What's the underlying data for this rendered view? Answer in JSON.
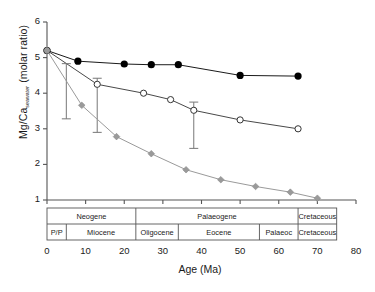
{
  "chart_data": {
    "type": "line",
    "title": "",
    "xlabel": "Age (Ma)",
    "ylabel_html": "Mg/Ca<sub>seawater</sub> (molar ratio)",
    "ylabel_main": "Mg/Ca",
    "ylabel_sub": "seawater",
    "ylabel_tail": " (molar ratio)",
    "xlim": [
      0,
      80
    ],
    "ylim": [
      1,
      6
    ],
    "xticks": [
      0,
      10,
      20,
      30,
      40,
      50,
      60,
      70,
      80
    ],
    "yticks": [
      1,
      2,
      3,
      4,
      5,
      6
    ],
    "grid": false,
    "legend": "none",
    "series": [
      {
        "name": "black-filled-circles",
        "marker": "filled-circle",
        "color": "#000000",
        "x": [
          0,
          8,
          20,
          27,
          34,
          50,
          65
        ],
        "values": [
          5.2,
          4.9,
          4.82,
          4.8,
          4.8,
          4.5,
          4.48
        ]
      },
      {
        "name": "open-circles",
        "marker": "open-circle",
        "color": "#333333",
        "x": [
          0,
          13,
          25,
          32,
          38,
          50,
          65
        ],
        "values": [
          5.2,
          4.25,
          4.0,
          3.82,
          3.52,
          3.25,
          3.0
        ],
        "error_bars": [
          {
            "x": 5,
            "y": 4.8,
            "low": 3.28,
            "high": 4.83
          },
          {
            "x": 13,
            "y": 4.25,
            "low": 2.9,
            "high": 4.42
          },
          {
            "x": 38,
            "y": 3.52,
            "low": 2.45,
            "high": 3.75
          }
        ]
      },
      {
        "name": "grey-diamonds",
        "marker": "filled-diamond",
        "color": "#9a9a9a",
        "x": [
          0,
          9,
          18,
          27,
          36,
          45,
          54,
          63,
          70
        ],
        "values": [
          5.2,
          3.66,
          2.78,
          2.3,
          1.85,
          1.57,
          1.38,
          1.22,
          1.05
        ]
      }
    ],
    "timescale": {
      "row1": [
        {
          "label": "Neogene",
          "start": 0,
          "end": 23
        },
        {
          "label": "Palaeogene",
          "start": 23,
          "end": 65
        },
        {
          "label": "Cretaceous",
          "start": 65,
          "end": 75
        }
      ],
      "row2": [
        {
          "label": "P/P",
          "start": 0,
          "end": 5
        },
        {
          "label": "Miocene",
          "start": 5,
          "end": 23
        },
        {
          "label": "Oligocene",
          "start": 23,
          "end": 34
        },
        {
          "label": "Eocene",
          "start": 34,
          "end": 55
        },
        {
          "label": "Palaeoc",
          "start": 55,
          "end": 65
        },
        {
          "label": "Cretaceous",
          "start": 65,
          "end": 75
        }
      ]
    }
  }
}
